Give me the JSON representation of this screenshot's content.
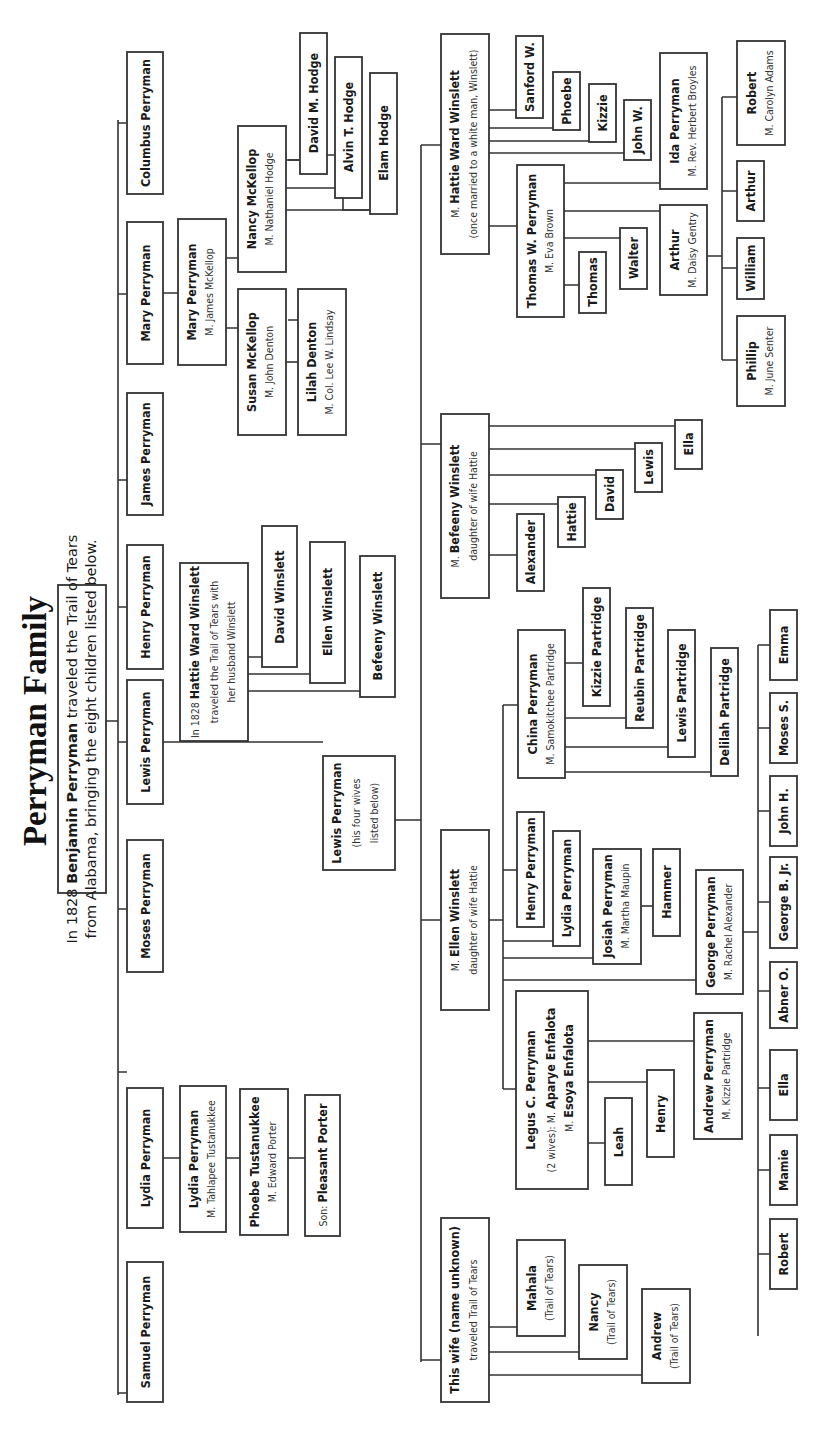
{
  "title": "Perryman Family",
  "intro": {
    "line1_pre": "In 1828 ",
    "line1_bold": "Benjamin Perryman",
    "line1_post": " traveled the Trail of Tears",
    "line2": "from Alabama, bringing the eight children listed below."
  },
  "children": [
    {
      "name": "Samuel Perryman"
    },
    {
      "name": "Lydia Perryman"
    },
    {
      "name": "Moses Perryman"
    },
    {
      "name": "Lewis Perryman"
    },
    {
      "name": "Henry Perryman"
    },
    {
      "name": "James Perryman"
    },
    {
      "name": "Mary Perryman"
    },
    {
      "name": "Columbus Perryman"
    }
  ],
  "lydia_line": {
    "lydia": {
      "name": "Lydia Perryman",
      "spouse": "M. Tahlapee Tustanukkee"
    },
    "phoebe": {
      "name": "Phoebe Tustanukkee",
      "spouse": "M. Edward Porter"
    },
    "son": {
      "prefix": "Son: ",
      "name": "Pleasant Porter"
    }
  },
  "mary_line": {
    "mary": {
      "name": "Mary Perryman",
      "spouse": "M. James McKellop"
    },
    "susan": {
      "name": "Susan McKellop",
      "spouse": "M. John Denton"
    },
    "lilah": {
      "name": "Lilah Denton",
      "spouse": "M. Col. Lee W. Lindsay"
    },
    "nancy": {
      "name": "Nancy McKellop",
      "spouse": "M. Nathaniel Hodge"
    },
    "hodge_children": [
      "David M. Hodge",
      "Alvin T. Hodge",
      "Elam Hodge"
    ]
  },
  "hattie_note": {
    "pre": "In 1828 ",
    "bold": "Hattie Ward Winslett",
    "line2": "traveled the Trail of Tears with",
    "line3": "her husband Winslett",
    "children": [
      "David Winslett",
      "Ellen Winslett",
      "Befeeny Winslett"
    ]
  },
  "lewis": {
    "name": "Lewis Perryman",
    "line2": "(his four wives",
    "line3": "listed below)"
  },
  "wives": {
    "unknown": {
      "name": "This wife (name unknown)",
      "note": "traveled Trail of Tears",
      "children": [
        {
          "name": "Mahala",
          "note": "(Trail of Tears)"
        },
        {
          "name": "Nancy",
          "note": "(Trail of Tears)"
        },
        {
          "name": "Andrew",
          "note": "(Trail of Tears)"
        }
      ]
    },
    "ellen": {
      "prefix": "M. ",
      "name": "Ellen Winslett",
      "note": "daughter of wife Hattie"
    },
    "befeeny": {
      "prefix": "M. ",
      "name": "Befeeny Winslett",
      "note": "daughter of wife Hattie",
      "children": [
        "Alexander",
        "Hattie",
        "David",
        "Lewis",
        "Ella"
      ]
    },
    "hattie": {
      "prefix": "M. ",
      "name": "Hattie Ward Winslett",
      "note": "(once married to a white man, Winslett)",
      "children": [
        "Sanford W.",
        "Phoebe",
        "Kizzie",
        "John W."
      ]
    }
  },
  "ellen_children": {
    "legus": {
      "name": "Legus C. Perryman",
      "note": "(2 wives): M. ",
      "wife1": "Aparye Enfalota",
      "wife2_prefix": "M. ",
      "wife2": "Esoya Enfalota",
      "children": [
        "Leah",
        "Henry"
      ]
    },
    "andrew": {
      "name": "Andrew Perryman",
      "spouse": "M. Kizzie Partridge",
      "children": [
        "Robert",
        "Mamie",
        "Ella"
      ]
    },
    "henry": {
      "name": "Henry Perryman"
    },
    "lydia": {
      "name": "Lydia Perryman"
    },
    "josiah": {
      "name": "Josiah Perryman",
      "spouse": "M. Martha Maupin",
      "child": "Hammer"
    },
    "george": {
      "name": "George Perryman",
      "spouse": "M. Rachel Alexander",
      "children": [
        "Abner O.",
        "George B. Jr.",
        "John H.",
        "Moses S.",
        "Emma"
      ]
    },
    "china": {
      "name": "China Perryman",
      "spouse": "M. Samokitchee Partridge",
      "children": [
        "Kizzie Partridge",
        "Reubin Partridge",
        "Lewis Partridge",
        "Delilah Partridge"
      ]
    }
  },
  "thomas_line": {
    "thomas": {
      "name": "Thomas W. Perryman",
      "spouse": "M. Eva Brown"
    },
    "children": [
      {
        "name": "Thomas"
      },
      {
        "name": "Walter"
      },
      {
        "name": "Arthur",
        "spouse": "M. Daisy Gentry"
      },
      {
        "name": "Ida Perryman",
        "spouse": "M. Rev. Herbert Broyles"
      }
    ],
    "arthur_children": [
      {
        "name": "Phillip",
        "spouse": "M. June Senter"
      },
      {
        "name": "William"
      },
      {
        "name": "Arthur"
      },
      {
        "name": "Robert",
        "spouse": "M. Carolyn Adams"
      }
    ]
  }
}
